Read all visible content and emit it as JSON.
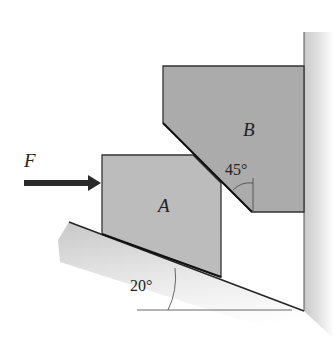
{
  "diagram": {
    "labels": {
      "force": "F",
      "block_a": "A",
      "block_b": "B",
      "angle_wedge": "45°",
      "angle_incline": "20°"
    },
    "colors": {
      "block_fill": "#b9b9b9",
      "block_b_fill": "#a9a9a9",
      "outline": "#333333",
      "arrow": "#2a2a2a",
      "ground": "#d8d8d8"
    }
  }
}
